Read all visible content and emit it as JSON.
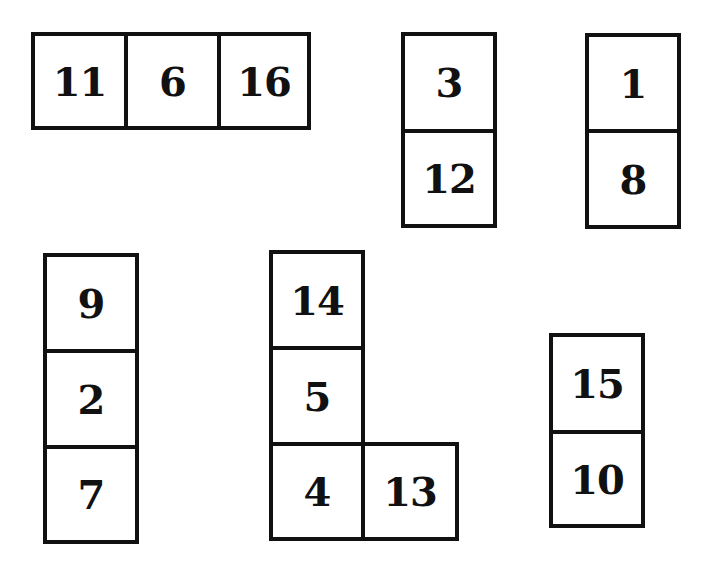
{
  "puzzle": {
    "pieces": [
      {
        "id": "piece-a",
        "cells": [
          "11",
          "6",
          "16"
        ]
      },
      {
        "id": "piece-b",
        "cells": [
          "3",
          "12"
        ]
      },
      {
        "id": "piece-c",
        "cells": [
          "1",
          "8"
        ]
      },
      {
        "id": "piece-d",
        "cells": [
          "9",
          "2",
          "7"
        ]
      },
      {
        "id": "piece-e",
        "cells": [
          "14",
          "5",
          "4",
          "13"
        ]
      },
      {
        "id": "piece-f",
        "cells": [
          "15",
          "10"
        ]
      }
    ]
  },
  "colors": {
    "border": "#111111",
    "fill": "#ffffff",
    "text": "#111111"
  }
}
